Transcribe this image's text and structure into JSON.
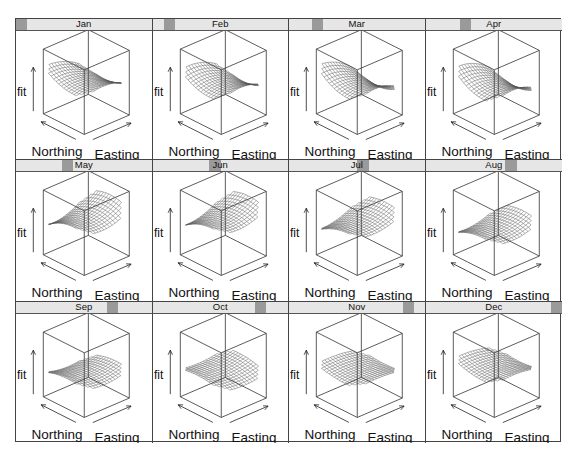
{
  "figure": {
    "type": "lattice-wireframe",
    "layout": {
      "columns": 4,
      "rows": 3
    },
    "axis_labels": {
      "z": "fit",
      "x": "Easting",
      "y": "Northing"
    },
    "strip_colors": {
      "background": "#e6e6e6",
      "marker": "#9a9a9a"
    },
    "frame_color": "#444444",
    "surface_color": "#555555"
  },
  "chart_data": {
    "type": "wireframe",
    "title": "",
    "panels_by": "month",
    "xlabel": "Easting",
    "ylabel": "Northing",
    "zlabel": "fit",
    "panels": [
      {
        "label": "Jan",
        "index": 1,
        "shape": "saddle-rise-east",
        "tilt": -0.55,
        "curve": 0.35,
        "height": 0.55,
        "drop": 0.25
      },
      {
        "label": "Feb",
        "index": 2,
        "shape": "saddle-rise-east",
        "tilt": -0.5,
        "curve": 0.4,
        "height": 0.52,
        "drop": 0.3
      },
      {
        "label": "Mar",
        "index": 3,
        "shape": "peak-north-east",
        "tilt": -0.75,
        "curve": 0.45,
        "height": 0.5,
        "drop": 0.35
      },
      {
        "label": "Apr",
        "index": 4,
        "shape": "peak-north-east",
        "tilt": -0.7,
        "curve": 0.45,
        "height": 0.48,
        "drop": 0.4
      },
      {
        "label": "May",
        "index": 5,
        "shape": "steep-fold",
        "tilt": 0.65,
        "curve": -0.4,
        "height": 0.62,
        "drop": 0.65
      },
      {
        "label": "Jun",
        "index": 6,
        "shape": "steep-fold",
        "tilt": 0.7,
        "curve": -0.35,
        "height": 0.62,
        "drop": 0.75
      },
      {
        "label": "Jul",
        "index": 7,
        "shape": "steep-fold",
        "tilt": 0.65,
        "curve": -0.3,
        "height": 0.55,
        "drop": 0.7
      },
      {
        "label": "Aug",
        "index": 8,
        "shape": "bowl",
        "tilt": 0.45,
        "curve": -0.3,
        "height": 0.45,
        "drop": 0.55
      },
      {
        "label": "Sep",
        "index": 9,
        "shape": "ridge",
        "tilt": 0.15,
        "curve": -0.25,
        "height": 0.4,
        "drop": 0.4
      },
      {
        "label": "Oct",
        "index": 10,
        "shape": "flat-sag",
        "tilt": -0.1,
        "curve": -0.2,
        "height": 0.42,
        "drop": 0.3
      },
      {
        "label": "Nov",
        "index": 11,
        "shape": "flat-sag",
        "tilt": -0.2,
        "curve": 0.15,
        "height": 0.45,
        "drop": 0.2
      },
      {
        "label": "Dec",
        "index": 12,
        "shape": "flat-sag",
        "tilt": -0.3,
        "curve": 0.2,
        "height": 0.5,
        "drop": 0.25
      }
    ],
    "legend": null,
    "grid": false
  }
}
